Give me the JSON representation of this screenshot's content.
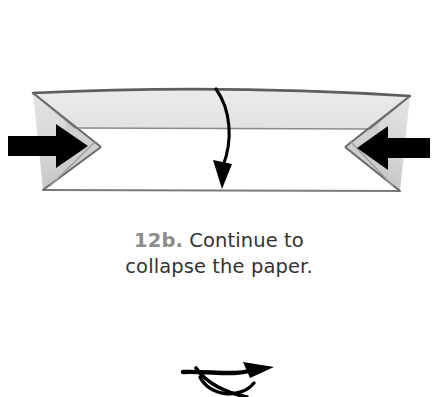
{
  "page": {
    "background_color": "#ffffff",
    "width": 438,
    "height": 397
  },
  "caption": {
    "step_number": "12b.",
    "line1_text": " Continue to",
    "line2_text": "collapse the paper.",
    "full_text": "12b. Continue to collapse the paper.",
    "step_number_color": "#8d8d8d",
    "text_color": "#333333"
  },
  "diagram": {
    "name": "collapsing-paper-model",
    "paper": {
      "outline_color": "#6a6a6a",
      "top_band_fill": "#e6e6e6",
      "flap_fill": "#dcdcdc",
      "body_fill": "#ffffff",
      "shadow_color": "#b4b4b4"
    },
    "annotations": [
      {
        "name": "push-arrow-left",
        "type": "push-arrow",
        "direction": "right",
        "color": "#000000",
        "meaning": "push inward from the left"
      },
      {
        "name": "push-arrow-right",
        "type": "push-arrow",
        "direction": "left",
        "color": "#000000",
        "meaning": "push inward from the right"
      },
      {
        "name": "fold-down-arrow",
        "type": "curved-arrow",
        "direction": "down",
        "color": "#000000",
        "meaning": "fold the front layer downward"
      },
      {
        "name": "turn-over-symbol",
        "type": "turn-over-arrow",
        "direction": "right",
        "color": "#000000",
        "meaning": "turn the model over"
      }
    ]
  }
}
